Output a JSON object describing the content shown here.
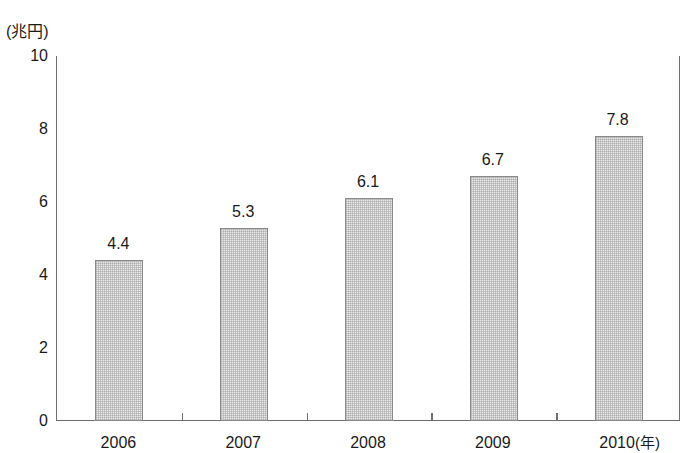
{
  "chart_data": {
    "type": "bar",
    "title": "",
    "subtitle": "",
    "xlabel": "年",
    "ylabel": "兆円",
    "y_unit_caption": "(兆円)",
    "x_unit_caption": "(年)",
    "categories": [
      "2006",
      "2007",
      "2008",
      "2009",
      "2010"
    ],
    "values": [
      4.4,
      5.3,
      6.1,
      6.7,
      7.8
    ],
    "value_labels": [
      "4.4",
      "5.3",
      "6.1",
      "6.7",
      "7.8"
    ],
    "ylim": [
      0,
      10
    ],
    "yticks": [
      0,
      2,
      4,
      6,
      8,
      10
    ],
    "ytick_labels": [
      "0",
      "2",
      "4",
      "6",
      "8",
      "10"
    ],
    "grid": false,
    "legend": null,
    "legend_position": "none",
    "bar_fill_color": "#e9e9e9",
    "bar_border_color": "#8a8a8a",
    "axis_color": "#6e6e6e",
    "text_color": "#1a1a1a",
    "background_color": "#ffffff",
    "annotations": []
  },
  "axis": {
    "y_unit": "(兆円)",
    "x_unit": "(年)"
  }
}
